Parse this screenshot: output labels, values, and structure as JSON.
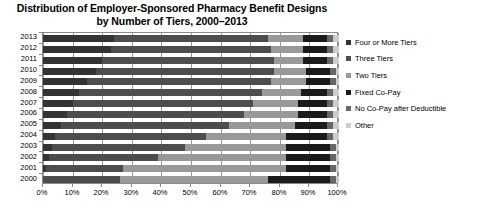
{
  "title": {
    "line1": "Distribution of Employer-Sponsored Pharmacy Benefit Designs",
    "line2": "by Number of Tiers, 2000–2013"
  },
  "legend": {
    "position": "right",
    "items": [
      {
        "label": "Four or More Tiers",
        "color": "#333333"
      },
      {
        "label": "Three Tiers",
        "color": "#4d4d4d"
      },
      {
        "label": "Two Tiers",
        "color": "#999999"
      },
      {
        "label": "Fixed Co-Pay",
        "color": "#1a1a1a"
      },
      {
        "label": "No Co-Pay after Deductible",
        "color": "#666666"
      },
      {
        "label": "Other",
        "color": "#cccccc"
      }
    ]
  },
  "axes": {
    "x_ticks": [
      "0%",
      "10%",
      "20%",
      "30%",
      "40%",
      "50%",
      "60%",
      "70%",
      "80%",
      "90%",
      "100%"
    ],
    "x_min": 0,
    "x_max": 100,
    "y_ticks": [
      "2013",
      "2012",
      "2011",
      "2010",
      "2009",
      "2008",
      "2007",
      "2006",
      "2005",
      "2004",
      "2003",
      "2002",
      "2001",
      "2000"
    ]
  },
  "chart_data": {
    "type": "bar",
    "orientation": "horizontal",
    "stacked": true,
    "normalized_percent": true,
    "title": "Distribution of Employer-Sponsored Pharmacy Benefit Designs by Number of Tiers, 2000–2013",
    "xlabel": "",
    "ylabel": "",
    "xlim": [
      0,
      100
    ],
    "grid": true,
    "grid_axis": "x",
    "legend_position": "right",
    "categories": [
      "2013",
      "2012",
      "2011",
      "2010",
      "2009",
      "2008",
      "2007",
      "2006",
      "2005",
      "2004",
      "2003",
      "2002",
      "2001",
      "2000"
    ],
    "series": [
      {
        "name": "Four or More Tiers",
        "color": "#333333",
        "values": [
          24,
          23,
          20,
          18,
          15,
          12,
          10,
          8,
          6,
          4,
          3,
          2,
          1,
          0
        ]
      },
      {
        "name": "Three Tiers",
        "color": "#4d4d4d",
        "values": [
          52,
          54,
          58,
          60,
          62,
          62,
          61,
          60,
          57,
          51,
          45,
          37,
          26,
          26
        ]
      },
      {
        "name": "Two Tiers",
        "color": "#999999",
        "values": [
          12,
          11,
          10,
          11,
          12,
          13,
          15,
          18,
          22,
          27,
          34,
          43,
          55,
          50
        ]
      },
      {
        "name": "Fixed Co-Pay",
        "color": "#1a1a1a",
        "values": [
          8,
          8,
          8,
          8,
          8,
          9,
          10,
          10,
          11,
          14,
          15,
          15,
          15,
          21
        ]
      },
      {
        "name": "No Co-Pay after Deductible",
        "color": "#666666",
        "values": [
          2,
          2,
          2,
          2,
          2,
          2,
          2,
          2,
          2,
          2,
          2,
          2,
          2,
          2
        ]
      },
      {
        "name": "Other",
        "color": "#cccccc",
        "values": [
          2,
          2,
          2,
          1,
          1,
          2,
          2,
          2,
          2,
          2,
          1,
          1,
          1,
          1
        ]
      }
    ]
  }
}
